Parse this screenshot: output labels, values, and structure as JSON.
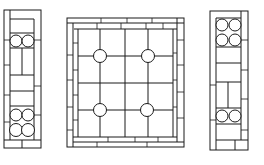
{
  "figure": {
    "title": "Leaded glass window panels",
    "stroke_color": "#1a1a1a",
    "background_color": "#ffffff"
  },
  "panels": [
    {
      "name": "left-sidelight",
      "jewel_groups": [
        {
          "position": "upper",
          "rows": 1,
          "cols": 2
        },
        {
          "position": "lower",
          "rows": 2,
          "cols": 2
        }
      ]
    },
    {
      "name": "center-panel",
      "grid": {
        "cols": 4,
        "rows": 4
      },
      "jewels": 4
    },
    {
      "name": "right-sidelight",
      "jewel_groups": [
        {
          "position": "upper",
          "rows": 2,
          "cols": 2
        },
        {
          "position": "lower",
          "rows": 1,
          "cols": 2
        }
      ]
    }
  ]
}
